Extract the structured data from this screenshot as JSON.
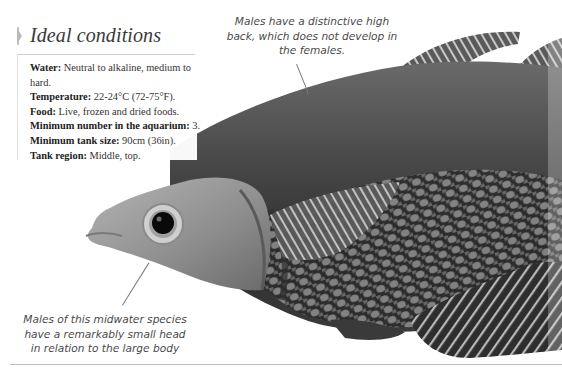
{
  "info_box": {
    "title": "Ideal conditions",
    "rows": [
      {
        "label": "Water:",
        "value": " Neutral to alkaline, medium to hard."
      },
      {
        "label": "Temperature:",
        "value": " 22-24°C (72-75°F)."
      },
      {
        "label": "Food:",
        "value": " Live, frozen and dried foods."
      },
      {
        "label": "Minimum number in the aquarium:",
        "value": " 3."
      },
      {
        "label": "Minimum tank size:",
        "value": " 90cm (36in)."
      },
      {
        "label": "Tank region:",
        "value": " Middle, top."
      }
    ]
  },
  "callouts": {
    "top": "Males have a distinctive high back, which does not develop in the females.",
    "bottom": "Males of this midwater species have a remarkably small head in relation to the large body"
  },
  "image": {
    "subject": "fish-photo",
    "colors": {
      "body_dark": "#2b2b2b",
      "body_mid": "#5a5a5a",
      "head": "#9a9a9a",
      "fin": "#6e6e6e",
      "scale_highlight": "#bdbdbd"
    }
  }
}
